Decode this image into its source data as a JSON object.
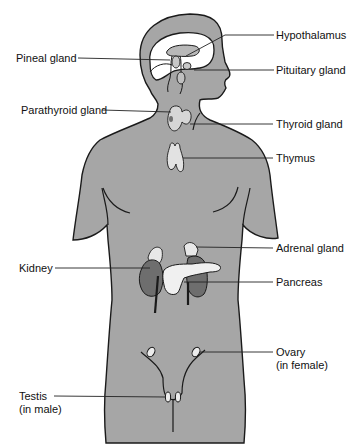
{
  "colors": {
    "body_fill": "#a6a6a6",
    "outline": "#1a1a1a",
    "brain_fill": "#ffffff",
    "gland_light": "#e6e6e6",
    "kidney_fill": "#6e6e6e",
    "leader_line": "#222222"
  },
  "labels": {
    "left": [
      {
        "id": "pineal",
        "text": "Pineal gland"
      },
      {
        "id": "parathyroid",
        "text": "Parathyroid gland"
      },
      {
        "id": "kidney",
        "text": "Kidney"
      },
      {
        "id": "testis",
        "line1": "Testis",
        "line2": "(in male)"
      }
    ],
    "right": [
      {
        "id": "hypothalamus",
        "text": "Hypothalamus"
      },
      {
        "id": "pituitary",
        "text": "Pituitary gland"
      },
      {
        "id": "thyroid",
        "text": "Thyroid gland"
      },
      {
        "id": "thymus",
        "text": "Thymus"
      },
      {
        "id": "adrenal",
        "text": "Adrenal gland"
      },
      {
        "id": "pancreas",
        "text": "Pancreas"
      },
      {
        "id": "ovary",
        "line1": "Ovary",
        "line2": "(in female)"
      }
    ]
  }
}
